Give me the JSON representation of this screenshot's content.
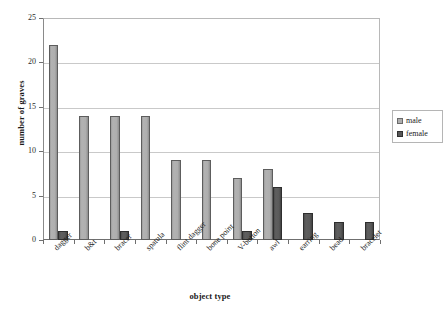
{
  "chart_data": {
    "type": "bar",
    "title": "",
    "xlabel": "object type",
    "ylabel": "number of graves",
    "ylim": [
      0,
      25
    ],
    "yticks": [
      0,
      5,
      10,
      15,
      20,
      25
    ],
    "grid": true,
    "legend_position": "right",
    "categories": [
      "dagger",
      "b&t",
      "bracer",
      "spatula",
      "flint dagger",
      "bone point",
      "V-button",
      "awl",
      "earring",
      "bead",
      "bracelet"
    ],
    "series": [
      {
        "name": "male",
        "color": "#aeaeae",
        "values": [
          22,
          14,
          14,
          14,
          9,
          9,
          7,
          8,
          0,
          0,
          0
        ]
      },
      {
        "name": "female",
        "color": "#575757",
        "values": [
          1,
          0,
          1,
          0,
          0,
          0,
          1,
          6,
          3,
          2,
          2
        ]
      }
    ]
  },
  "legend": {
    "entries": [
      {
        "label": "male"
      },
      {
        "label": "female"
      }
    ]
  }
}
